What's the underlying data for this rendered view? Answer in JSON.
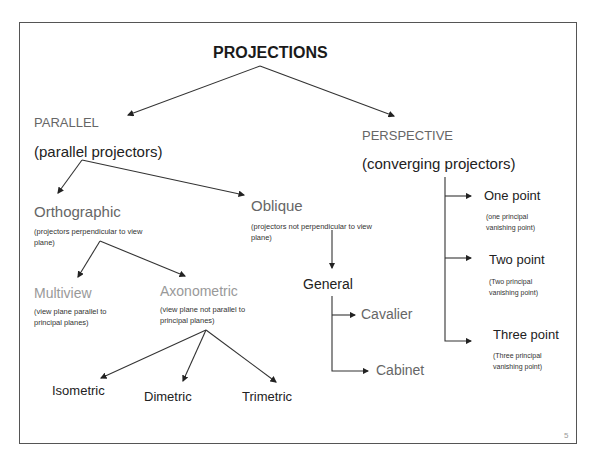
{
  "slide": {
    "title": "PROJECTIONS",
    "page_number": "5",
    "parallel": {
      "label": "PARALLEL",
      "desc": "(parallel projectors)"
    },
    "perspective": {
      "label": "PERSPECTIVE",
      "desc": "(converging projectors)"
    },
    "orthographic": {
      "label": "Orthographic",
      "desc": "(projectors perpendicular to view plane)"
    },
    "oblique": {
      "label": "Oblique",
      "desc": "(projectors not perpendicular to view plane)"
    },
    "multiview": {
      "label": "Multiview",
      "desc": "(view plane parallel to principal planes)"
    },
    "axonometric": {
      "label": "Axonometric",
      "desc": "(view plane not parallel to principal planes)"
    },
    "general": {
      "label": "General"
    },
    "cavalier": {
      "label": "Cavalier"
    },
    "cabinet": {
      "label": "Cabinet"
    },
    "isometric": {
      "label": "Isometric"
    },
    "dimetric": {
      "label": "Dimetric"
    },
    "trimetric": {
      "label": "Trimetric"
    },
    "one_point": {
      "label": "One point",
      "desc": "(one principal vanishing point)"
    },
    "two_point": {
      "label": "Two point",
      "desc": "(Two principal vanishing point)"
    },
    "three_point": {
      "label": "Three point",
      "desc": "(Three principal vanishing point)"
    }
  }
}
